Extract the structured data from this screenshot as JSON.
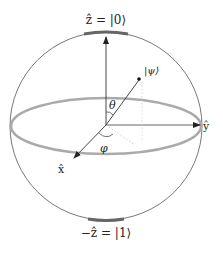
{
  "diagram": {
    "labels": {
      "north_pole": "ẑ = |0⟩",
      "south_pole": "−ẑ = |1⟩",
      "state": "|ψ⟩",
      "theta": "θ",
      "phi": "φ",
      "x_axis": "x̂",
      "y_axis": "ŷ"
    },
    "colors": {
      "outline": "#555555",
      "equator": "#a9a9a9",
      "axes": "#333333",
      "pole_band": "#6a6a6a",
      "dashed": "#bbbbbb"
    },
    "geometry": {
      "center": [
        106,
        125
      ],
      "radius_x": 96,
      "radius_y": 94,
      "equator_ry": 28,
      "state_point": [
        142,
        78
      ]
    }
  }
}
